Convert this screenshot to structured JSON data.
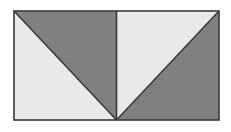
{
  "figure": {
    "name": "two-square-shaded-triangles",
    "background_color": "#ffffff",
    "stroke_color": "#3a3a3a",
    "stroke_width": 1.6,
    "light_fill": "#e8e8e8",
    "dark_fill": "#808080",
    "bounds": {
      "x": 14,
      "y": 11,
      "width": 205,
      "height": 109,
      "center_x": 116.5,
      "right": 219,
      "bottom": 120
    },
    "regions": [
      {
        "id": "left-upper-right-triangle",
        "label": "left square upper-right triangle",
        "shade": "dark",
        "fill": "#808080",
        "points": "14,11 219,11 116.5,120"
      },
      {
        "id": "left-lower-left-triangle",
        "label": "left square lower-left triangle",
        "shade": "light",
        "fill": "#e8e8e8",
        "points": "14,11 116.5,120 14,120"
      },
      {
        "id": "right-upper-left-triangle",
        "label": "right square upper-left triangle",
        "shade": "light",
        "fill": "#e8e8e8",
        "points": "116.5,11 219,11 116.5,120"
      },
      {
        "id": "right-lower-right-triangle",
        "label": "right square lower-right triangle",
        "shade": "dark",
        "fill": "#808080",
        "points": "219,11 219,120 116.5,120"
      }
    ],
    "lines": [
      {
        "id": "vertical-center-divider",
        "label": "vertical center divider",
        "x1": 116.5,
        "y1": 11,
        "x2": 116.5,
        "y2": 120
      },
      {
        "id": "left-diagonal",
        "label": "left square diagonal",
        "x1": 14,
        "y1": 11,
        "x2": 116.5,
        "y2": 120
      },
      {
        "id": "right-diagonal",
        "label": "right square diagonal",
        "x1": 116.5,
        "y1": 120,
        "x2": 219,
        "y2": 11
      }
    ]
  }
}
